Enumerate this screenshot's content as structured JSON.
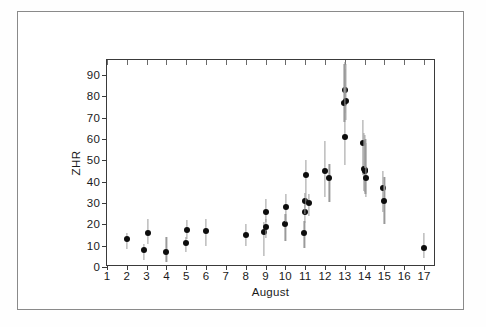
{
  "figure": {
    "background_color": "#ffffff",
    "frame_color": "#8a8a8a",
    "axis_color": "#3a3a3a",
    "marker_color": "#0d0d0d",
    "errorbar_color": "#9a9a9a"
  },
  "chart_data": {
    "type": "scatter",
    "title": "",
    "xlabel": "August",
    "ylabel": "ZHR",
    "xlim": [
      1,
      17.6
    ],
    "ylim": [
      0,
      97
    ],
    "grid": false,
    "legend": null,
    "xticks": [
      1,
      2,
      3,
      4,
      5,
      6,
      7,
      8,
      9,
      10,
      11,
      12,
      13,
      14,
      15,
      16,
      17
    ],
    "xtick_labels": [
      "1",
      "2",
      "3",
      "4",
      "5",
      "6",
      "7",
      "8",
      "9",
      "10",
      "11",
      "12",
      "13",
      "14",
      "15",
      "16",
      "17"
    ],
    "yticks": [
      0,
      10,
      20,
      30,
      40,
      50,
      60,
      70,
      80,
      90
    ],
    "ytick_labels": [
      "0",
      "10",
      "20",
      "30",
      "40",
      "50",
      "60",
      "70",
      "80",
      "90"
    ],
    "series": [
      {
        "name": "ZHR",
        "points": [
          {
            "x": 2.0,
            "y": 12.0,
            "ylo": 8.5,
            "yhi": 16.0
          },
          {
            "x": 2.88,
            "y": 7.0,
            "ylo": 3.5,
            "yhi": 11.0
          },
          {
            "x": 3.08,
            "y": 15.0,
            "ylo": 11.0,
            "yhi": 22.5
          },
          {
            "x": 4.0,
            "y": 6.0,
            "ylo": 2.5,
            "yhi": 14.0
          },
          {
            "x": 5.0,
            "y": 10.5,
            "ylo": 7.0,
            "yhi": 14.0
          },
          {
            "x": 5.04,
            "y": 16.5,
            "ylo": 13.0,
            "yhi": 22.0
          },
          {
            "x": 6.0,
            "y": 16.0,
            "ylo": 10.0,
            "yhi": 22.5
          },
          {
            "x": 8.0,
            "y": 14.0,
            "ylo": 10.0,
            "yhi": 20.0
          },
          {
            "x": 8.92,
            "y": 15.5,
            "ylo": 5.0,
            "yhi": 21.0
          },
          {
            "x": 9.0,
            "y": 18.0,
            "ylo": 13.5,
            "yhi": 22.5
          },
          {
            "x": 9.02,
            "y": 25.0,
            "ylo": 21.0,
            "yhi": 32.0
          },
          {
            "x": 10.0,
            "y": 19.0,
            "ylo": 12.0,
            "yhi": 25.0
          },
          {
            "x": 10.04,
            "y": 27.0,
            "ylo": 21.0,
            "yhi": 34.0
          },
          {
            "x": 10.96,
            "y": 15.0,
            "ylo": 9.0,
            "yhi": 21.5
          },
          {
            "x": 10.98,
            "y": 25.0,
            "ylo": 20.5,
            "yhi": 30.0
          },
          {
            "x": 11.0,
            "y": 30.0,
            "ylo": 25.0,
            "yhi": 34.5
          },
          {
            "x": 11.02,
            "y": 42.0,
            "ylo": 29.0,
            "yhi": 50.0
          },
          {
            "x": 11.18,
            "y": 29.0,
            "ylo": 24.0,
            "yhi": 34.0
          },
          {
            "x": 12.0,
            "y": 44.0,
            "ylo": 33.0,
            "yhi": 59.0
          },
          {
            "x": 12.22,
            "y": 41.0,
            "ylo": 30.5,
            "yhi": 48.5
          },
          {
            "x": 13.0,
            "y": 82.0,
            "ylo": 72.0,
            "yhi": 96.0
          },
          {
            "x": 12.98,
            "y": 76.0,
            "ylo": 68.0,
            "yhi": 95.0
          },
          {
            "x": 13.04,
            "y": 77.0,
            "ylo": 69.0,
            "yhi": 95.0
          },
          {
            "x": 13.02,
            "y": 60.0,
            "ylo": 48.0,
            "yhi": 93.0
          },
          {
            "x": 13.9,
            "y": 57.0,
            "ylo": 43.0,
            "yhi": 69.0
          },
          {
            "x": 13.96,
            "y": 45.0,
            "ylo": 35.5,
            "yhi": 63.0
          },
          {
            "x": 14.0,
            "y": 44.5,
            "ylo": 35.0,
            "yhi": 62.0
          },
          {
            "x": 14.04,
            "y": 44.0,
            "ylo": 34.0,
            "yhi": 60.0
          },
          {
            "x": 14.06,
            "y": 41.0,
            "ylo": 33.0,
            "yhi": 58.0
          },
          {
            "x": 14.94,
            "y": 36.0,
            "ylo": 26.0,
            "yhi": 45.0
          },
          {
            "x": 15.0,
            "y": 30.0,
            "ylo": 20.0,
            "yhi": 42.0
          },
          {
            "x": 17.0,
            "y": 8.0,
            "ylo": 4.0,
            "yhi": 16.0
          }
        ]
      }
    ]
  }
}
